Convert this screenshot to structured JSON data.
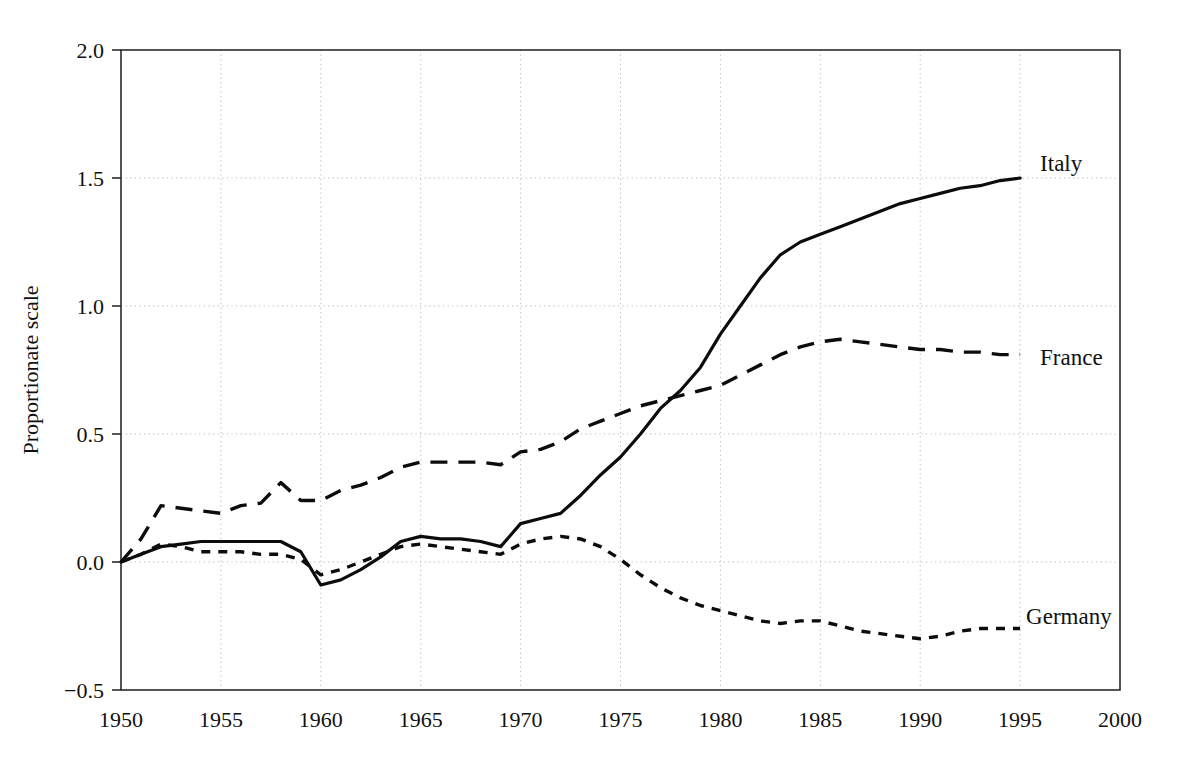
{
  "chart_data": {
    "type": "line",
    "title": "",
    "xlabel": "",
    "ylabel": "Proportionate scale",
    "xlim": [
      1950,
      2000
    ],
    "ylim": [
      -0.5,
      2.0
    ],
    "xticks": [
      1950,
      1955,
      1960,
      1965,
      1970,
      1975,
      1980,
      1985,
      1990,
      1995,
      2000
    ],
    "xtick_labels": [
      "1950",
      "1955",
      "1960",
      "1965",
      "1970",
      "1975",
      "1980",
      "1985",
      "1990",
      "1995",
      "2000"
    ],
    "yticks": [
      -0.5,
      0.0,
      0.5,
      1.0,
      1.5,
      2.0
    ],
    "ytick_labels": [
      "−0.5",
      "0.0",
      "0.5",
      "1.0",
      "1.5",
      "2.0"
    ],
    "grid": true,
    "legend_position": "right-inline-annotations",
    "x": [
      1950,
      1951,
      1952,
      1953,
      1954,
      1955,
      1956,
      1957,
      1958,
      1959,
      1960,
      1961,
      1962,
      1963,
      1964,
      1965,
      1966,
      1967,
      1968,
      1969,
      1970,
      1971,
      1972,
      1973,
      1974,
      1975,
      1976,
      1977,
      1978,
      1979,
      1980,
      1981,
      1982,
      1983,
      1984,
      1985,
      1986,
      1987,
      1988,
      1989,
      1990,
      1991,
      1992,
      1993,
      1994,
      1995
    ],
    "series": [
      {
        "name": "Italy",
        "style": "solid",
        "values": [
          0.0,
          0.03,
          0.06,
          0.07,
          0.08,
          0.08,
          0.08,
          0.08,
          0.08,
          0.04,
          -0.09,
          -0.07,
          -0.03,
          0.02,
          0.08,
          0.1,
          0.09,
          0.09,
          0.08,
          0.06,
          0.15,
          0.17,
          0.19,
          0.26,
          0.34,
          0.41,
          0.5,
          0.6,
          0.67,
          0.76,
          0.89,
          1.0,
          1.11,
          1.2,
          1.25,
          1.28,
          1.31,
          1.34,
          1.37,
          1.4,
          1.42,
          1.44,
          1.46,
          1.47,
          1.49,
          1.5
        ]
      },
      {
        "name": "France",
        "style": "dashed",
        "values": [
          0.0,
          0.09,
          0.22,
          0.21,
          0.2,
          0.19,
          0.22,
          0.23,
          0.31,
          0.24,
          0.24,
          0.28,
          0.3,
          0.33,
          0.37,
          0.39,
          0.39,
          0.39,
          0.39,
          0.38,
          0.43,
          0.44,
          0.47,
          0.52,
          0.55,
          0.58,
          0.61,
          0.63,
          0.65,
          0.67,
          0.69,
          0.73,
          0.77,
          0.81,
          0.84,
          0.86,
          0.87,
          0.86,
          0.85,
          0.84,
          0.83,
          0.83,
          0.82,
          0.82,
          0.81,
          0.81
        ]
      },
      {
        "name": "Germany",
        "style": "dotted",
        "values": [
          0.0,
          0.03,
          0.07,
          0.06,
          0.04,
          0.04,
          0.04,
          0.03,
          0.03,
          0.01,
          -0.05,
          -0.03,
          0.0,
          0.03,
          0.06,
          0.07,
          0.06,
          0.05,
          0.04,
          0.03,
          0.07,
          0.09,
          0.1,
          0.09,
          0.06,
          0.01,
          -0.05,
          -0.1,
          -0.14,
          -0.17,
          -0.19,
          -0.21,
          -0.23,
          -0.24,
          -0.23,
          -0.23,
          -0.25,
          -0.27,
          -0.28,
          -0.29,
          -0.3,
          -0.29,
          -0.27,
          -0.26,
          -0.26,
          -0.26
        ]
      }
    ],
    "annotations": [
      {
        "text": "Italy",
        "x": 1996.0,
        "y": 1.56
      },
      {
        "text": "France",
        "x": 1996.0,
        "y": 0.8
      },
      {
        "text": "Germany",
        "x": 1995.3,
        "y": -0.21
      }
    ]
  }
}
